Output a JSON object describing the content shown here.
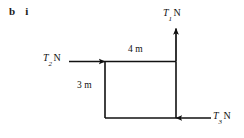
{
  "question": {
    "part": "b",
    "subpart": "i"
  },
  "diagram": {
    "shape": "rectangle",
    "stroke_color": "#111111",
    "background_color": "#ffffff",
    "dimensions": {
      "top": "4 m",
      "left": "3 m"
    },
    "forces": [
      {
        "id": "T1",
        "symbol": "T",
        "subscript": "1",
        "unit": "N",
        "direction": "up",
        "applied_at": "top-right-corner"
      },
      {
        "id": "T2",
        "symbol": "T",
        "subscript": "2",
        "unit": "N",
        "direction": "right",
        "applied_at": "top-left-corner"
      },
      {
        "id": "T3",
        "symbol": "T",
        "subscript": "3",
        "unit": "N",
        "direction": "left",
        "applied_at": "bottom-right-corner"
      }
    ]
  }
}
